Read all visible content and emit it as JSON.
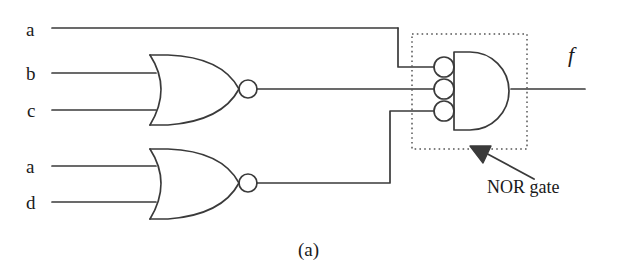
{
  "figure": {
    "caption": "(a)",
    "annotation": "NOR gate",
    "ink_color": "#3a3a3a",
    "background_color": "#ffffff",
    "width": 638,
    "height": 274
  },
  "inputs": [
    {
      "name": "input-a-top",
      "label": "a",
      "x": 26,
      "y": 20,
      "wire_y": 28
    },
    {
      "name": "input-b",
      "label": "b",
      "x": 26,
      "y": 64,
      "wire_y": 73
    },
    {
      "name": "input-c",
      "label": "c",
      "x": 27,
      "y": 101,
      "wire_y": 110
    },
    {
      "name": "input-a-bottom",
      "label": "a",
      "x": 26,
      "y": 157,
      "wire_y": 166
    },
    {
      "name": "input-d",
      "label": "d",
      "x": 26,
      "y": 193,
      "wire_y": 202
    }
  ],
  "output": {
    "label": "f",
    "x": 568,
    "y": 44,
    "wire_y": 89
  },
  "gates": [
    {
      "name": "nor-gate-1",
      "type": "NOR",
      "inputs": [
        "b",
        "c"
      ],
      "x": 150,
      "y": 55,
      "w": 90,
      "h": 70,
      "bubble": {
        "cx": 248,
        "cy": 89,
        "r": 9
      }
    },
    {
      "name": "nor-gate-2",
      "type": "NOR",
      "inputs": [
        "a",
        "d"
      ],
      "x": 150,
      "y": 149,
      "w": 90,
      "h": 70,
      "bubble": {
        "cx": 248,
        "cy": 183,
        "r": 9
      }
    },
    {
      "name": "nor-gate-output",
      "type": "NOR",
      "form": "demorgan-and-with-inverted-inputs",
      "inputs": [
        "a",
        "nor-gate-1",
        "nor-gate-2"
      ],
      "body": {
        "x": 454,
        "y": 52,
        "w": 62,
        "h": 78
      },
      "bubbles": [
        {
          "cx": 444,
          "cy": 67,
          "r": 10
        },
        {
          "cx": 444,
          "cy": 89,
          "r": 10
        },
        {
          "cx": 444,
          "cy": 111,
          "r": 10
        }
      ],
      "dotted_box": {
        "x": 412,
        "y": 34,
        "w": 115,
        "h": 115
      }
    }
  ],
  "caption_position": {
    "x": 310,
    "y": 240
  },
  "annotation_position": {
    "x": 487,
    "y": 178
  }
}
